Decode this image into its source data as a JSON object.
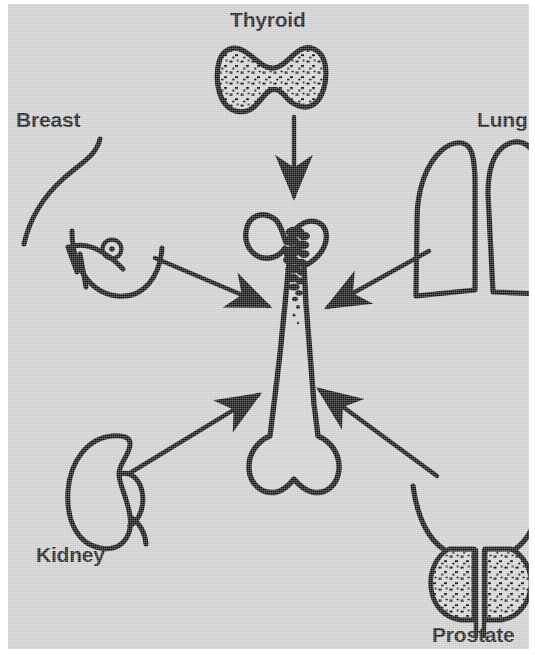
{
  "figure": {
    "background_color": "#cdcdcd",
    "ink_color": "#111111",
    "page_color": "#ffffff"
  },
  "labels": {
    "thyroid": "Thyroid",
    "breast": "Breast",
    "lung": "Lung",
    "kidney": "Kidney",
    "prostate": "Prostate"
  },
  "center": {
    "organ_name": "femur",
    "lesion_name": "metastatic-deposits"
  },
  "organs": [
    {
      "id": "thyroid",
      "label": "Thyroid",
      "position": "top-center",
      "fill": "stippled"
    },
    {
      "id": "breast",
      "label": "Breast",
      "position": "upper-left",
      "fill": "outline"
    },
    {
      "id": "lung",
      "label": "Lung",
      "position": "upper-right",
      "fill": "outline"
    },
    {
      "id": "kidney",
      "label": "Kidney",
      "position": "lower-left",
      "fill": "outline"
    },
    {
      "id": "prostate",
      "label": "Prostate",
      "position": "lower-right",
      "fill": "stippled"
    }
  ],
  "arrows": [
    {
      "id": "thyroid-to-bone",
      "from": "thyroid",
      "to": "femur",
      "direction": "down"
    },
    {
      "id": "breast-to-bone",
      "from": "breast",
      "to": "femur",
      "direction": "down-right"
    },
    {
      "id": "lung-to-bone",
      "from": "lung",
      "to": "femur",
      "direction": "down-left"
    },
    {
      "id": "kidney-to-bone",
      "from": "kidney",
      "to": "femur",
      "direction": "up-right"
    },
    {
      "id": "prostate-to-bone",
      "from": "prostate",
      "to": "femur",
      "direction": "up-left"
    }
  ]
}
